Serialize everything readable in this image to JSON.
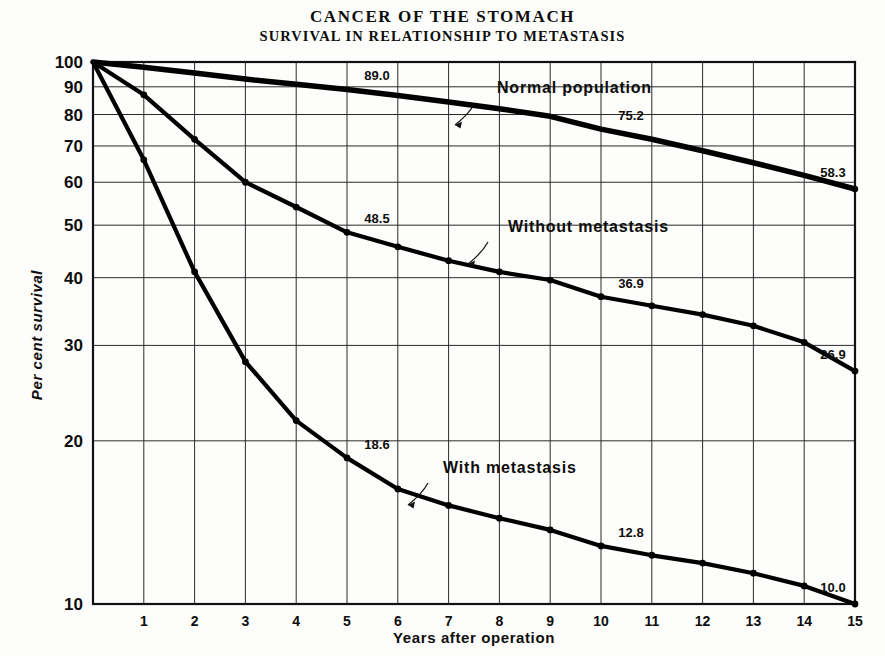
{
  "figure": {
    "title_main": "CANCER OF THE STOMACH",
    "title_sub": "SURVIVAL IN RELATIONSHIP TO METASTASIS"
  },
  "chart_data": {
    "type": "line",
    "title": "CANCER OF THE STOMACH",
    "subtitle": "SURVIVAL IN RELATIONSHIP TO METASTASIS",
    "xlabel": "Years after operation",
    "ylabel": "Per cent survival",
    "xlim": [
      0,
      15
    ],
    "ylim": [
      10,
      100
    ],
    "yscale": "log",
    "grid": true,
    "legend": "inline-annotations",
    "xticks": [
      1,
      2,
      3,
      4,
      5,
      6,
      7,
      8,
      9,
      10,
      11,
      12,
      13,
      14,
      15
    ],
    "xtick_labels": [
      "1",
      "2",
      "3",
      "4",
      "5",
      "6",
      "7",
      "8",
      "9",
      "10",
      "11",
      "12",
      "13",
      "14",
      "15"
    ],
    "yticks": [
      10,
      20,
      30,
      40,
      50,
      60,
      70,
      80,
      90,
      100
    ],
    "ytick_labels": [
      "10",
      "20",
      "30",
      "40",
      "50",
      "60",
      "70",
      "80",
      "90",
      "100"
    ],
    "x": [
      0,
      1,
      2,
      3,
      4,
      5,
      6,
      7,
      8,
      9,
      10,
      11,
      12,
      13,
      14,
      15
    ],
    "series": [
      {
        "name": "Normal population",
        "label": "Normal population",
        "values": [
          100.0,
          97.8,
          95.4,
          93.0,
          91.0,
          89.0,
          86.7,
          84.4,
          82.0,
          79.4,
          75.2,
          72.0,
          68.6,
          65.2,
          61.8,
          58.3
        ],
        "annotations": [
          {
            "x": 5,
            "value": 89.0,
            "text": "89.0"
          },
          {
            "x": 10,
            "value": 75.2,
            "text": "75.2"
          },
          {
            "x": 15,
            "value": 58.3,
            "text": "58.3"
          }
        ]
      },
      {
        "name": "Without metastasis",
        "label": "Without metastasis",
        "values": [
          100.0,
          87.0,
          72.0,
          60.0,
          54.0,
          48.5,
          45.6,
          43.0,
          41.0,
          39.6,
          36.9,
          35.5,
          34.2,
          32.6,
          30.4,
          26.9
        ],
        "annotations": [
          {
            "x": 5,
            "value": 48.5,
            "text": "48.5"
          },
          {
            "x": 10,
            "value": 36.9,
            "text": "36.9"
          },
          {
            "x": 15,
            "value": 26.9,
            "text": "26.9"
          }
        ]
      },
      {
        "name": "With metastasis",
        "label": "With metastasis",
        "values": [
          100.0,
          66.0,
          41.0,
          28.0,
          21.8,
          18.6,
          16.3,
          15.2,
          14.4,
          13.7,
          12.8,
          12.3,
          11.9,
          11.4,
          10.8,
          10.0
        ],
        "annotations": [
          {
            "x": 5,
            "value": 18.6,
            "text": "18.6"
          },
          {
            "x": 10,
            "value": 12.8,
            "text": "12.8"
          },
          {
            "x": 15,
            "value": 10.0,
            "text": "10.0"
          }
        ]
      }
    ]
  }
}
